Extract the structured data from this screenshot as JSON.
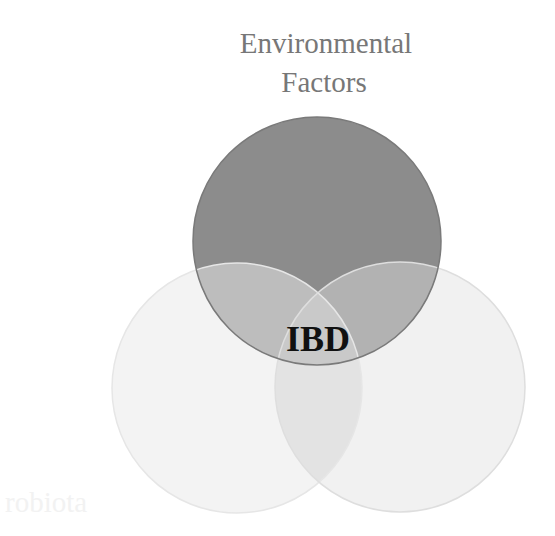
{
  "diagram": {
    "type": "venn",
    "sets": [
      {
        "id": "environmental",
        "label_lines": [
          "Environmental",
          "Factors"
        ],
        "fill": "#8c8c8c",
        "stroke": "#7a7a7a",
        "label_color": "#777777"
      },
      {
        "id": "microbiota",
        "label_lines": [
          "robiota"
        ],
        "fill": "#f3f3f3",
        "stroke": "#e6e6e6",
        "label_color": "#f2f2f2"
      },
      {
        "id": "third",
        "label_lines": [],
        "fill": "#f1f1f1",
        "stroke": "#dedede",
        "label_color": "#f2f2f2"
      }
    ],
    "overlaps": {
      "env_microbiota": "#bdbdbd",
      "env_third": "#b2b2b2",
      "microbiota_third": "#e3e3e3",
      "all_three": "#c9c9c9"
    },
    "center_label": "IBD",
    "center_label_color": "#111111"
  }
}
